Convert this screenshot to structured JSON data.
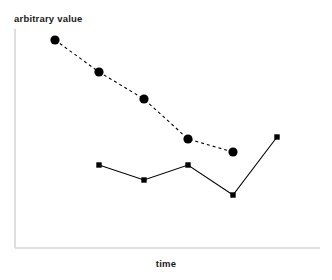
{
  "chart_data": {
    "type": "line",
    "title": "",
    "subtitle": "",
    "xlabel": "time",
    "ylabel": "arbitrary value",
    "grid": false,
    "legend": "none",
    "xlim": [
      0,
      6
    ],
    "ylim": [
      0,
      10
    ],
    "axis_ticks": {
      "x": [],
      "y": []
    },
    "annotations": [],
    "series": [
      {
        "name": "series-1",
        "marker": "circle",
        "linestyle": "dashed",
        "color": "#000000",
        "x": [
          1,
          2,
          3,
          4,
          5
        ],
        "values": [
          9.5,
          8.0,
          6.7,
          4.8,
          4.2
        ],
        "points_px": [
          [
            55,
            40
          ],
          [
            99,
            72
          ],
          [
            144,
            99
          ],
          [
            188,
            139
          ],
          [
            233,
            152
          ]
        ]
      },
      {
        "name": "series-2",
        "marker": "square",
        "linestyle": "solid",
        "color": "#000000",
        "x": [
          2,
          3,
          4,
          5,
          6
        ],
        "values": [
          3.8,
          3.1,
          3.8,
          2.4,
          5.1
        ],
        "points_px": [
          [
            99,
            165
          ],
          [
            144,
            180
          ],
          [
            188,
            165
          ],
          [
            233,
            195
          ],
          [
            277,
            137
          ]
        ]
      }
    ]
  },
  "axes": {
    "x_axis_color": "#d6d6d6",
    "y_axis_color": "#d6d6d6",
    "x_axis_px": {
      "x1": 15,
      "y1": 248,
      "x2": 320,
      "y2": 248
    },
    "y_axis_px": {
      "x1": 15,
      "y1": 29,
      "x2": 15,
      "y2": 248
    }
  },
  "style": {
    "background": "#ffffff",
    "ink": "#000000",
    "dash_pattern": "3 3",
    "circle_radius": 4.6,
    "square_size": 5.4,
    "line_width": 1.1
  }
}
